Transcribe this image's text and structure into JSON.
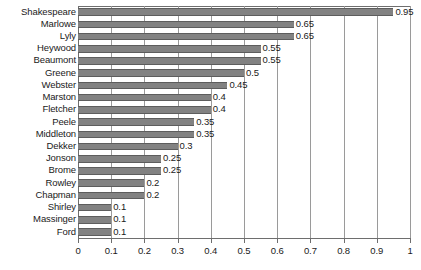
{
  "chart_data": {
    "type": "bar",
    "orientation": "horizontal",
    "title": "",
    "xlabel": "",
    "ylabel": "",
    "xlim": [
      0,
      1
    ],
    "xticks": [
      "0",
      "0.1",
      "0.2",
      "0.3",
      "0.4",
      "0.5",
      "0.6",
      "0.7",
      "0.8",
      "0.9",
      "1"
    ],
    "xtick_values": [
      0,
      0.1,
      0.2,
      0.3,
      0.4,
      0.5,
      0.6,
      0.7,
      0.8,
      0.9,
      1
    ],
    "grid": true,
    "grid_axis": "x",
    "legend": false,
    "bar_color": "#828282",
    "bar_edge_color": "#5d5d5d",
    "grid_color": "#9a9a9a",
    "axis_color": "#6e6e6e",
    "data_labels": true,
    "categories": [
      "Shakespeare",
      "Marlowe",
      "Lyly",
      "Heywood",
      "Beaumont",
      "Greene",
      "Webster",
      "Marston",
      "Fletcher",
      "Peele",
      "Middleton",
      "Dekker",
      "Jonson",
      "Brome",
      "Rowley",
      "Chapman",
      "Shirley",
      "Massinger",
      "Ford"
    ],
    "values": [
      0.95,
      0.65,
      0.65,
      0.55,
      0.55,
      0.5,
      0.45,
      0.4,
      0.4,
      0.35,
      0.35,
      0.3,
      0.25,
      0.25,
      0.2,
      0.2,
      0.1,
      0.1,
      0.1
    ],
    "value_labels": [
      "0.95",
      "0.65",
      "0.65",
      "0.55",
      "0.55",
      "0.5",
      "0.45",
      "0.4",
      "0.4",
      "0.35",
      "0.35",
      "0.3",
      "0.25",
      "0.25",
      "0.2",
      "0.2",
      "0.1",
      "0.1",
      "0.1"
    ]
  }
}
